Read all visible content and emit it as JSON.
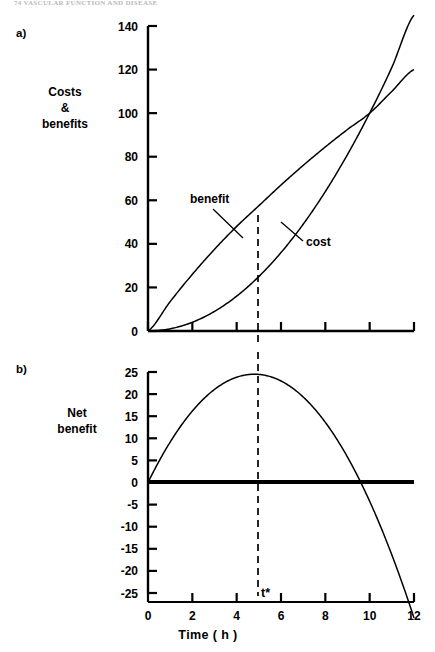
{
  "figure": {
    "running_head": "74  VASCULAR FUNCTION AND DISEASE",
    "panels": [
      {
        "letter": "a)",
        "y_axis_title": "Costs\n&\nbenefits"
      },
      {
        "letter": "b)",
        "y_axis_title": "Net\nbenefit"
      }
    ],
    "x_axis_title": "Time ( h )",
    "marker_label": "t*",
    "marker_value": 5,
    "curve_labels": {
      "benefit": "benefit",
      "cost": "cost"
    },
    "colors": {
      "ink": "#000000",
      "background": "#ffffff",
      "running_head": "#b9b9bd"
    }
  },
  "chart_data": [
    {
      "type": "line",
      "panel": "a)",
      "title": "",
      "xlabel": "Time ( h )",
      "ylabel": "Costs & benefits",
      "xlim": [
        0,
        12
      ],
      "ylim": [
        0,
        145
      ],
      "xticks": [
        0,
        2,
        4,
        6,
        8,
        10,
        12
      ],
      "yticks": [
        0,
        20,
        40,
        60,
        80,
        100,
        120,
        140
      ],
      "xticklabels": [
        "0",
        "2",
        "4",
        "6",
        "8",
        "10",
        "12"
      ],
      "yticklabels": [
        "0",
        "20",
        "40",
        "60",
        "80",
        "100",
        "120",
        "140"
      ],
      "grid": false,
      "legend": "inline-annotations",
      "x": [
        0,
        1,
        2,
        3,
        4,
        5,
        6,
        7,
        8,
        9,
        10,
        11,
        12
      ],
      "series": [
        {
          "name": "benefit",
          "shape": "concave-increasing",
          "values": [
            0,
            13.5,
            26,
            37.5,
            48,
            57.5,
            67,
            76,
            84.5,
            92.5,
            100,
            110,
            120
          ],
          "annotation": "benefit",
          "annotation_xy": [
            2.0,
            56
          ]
        },
        {
          "name": "cost",
          "shape": "convex-increasing",
          "values": [
            0,
            1,
            4,
            9,
            16,
            25,
            36,
            49,
            64,
            81,
            100,
            121,
            145
          ],
          "annotation": "cost",
          "annotation_xy": [
            7.4,
            46
          ]
        }
      ],
      "annotations": [
        {
          "text": "benefit",
          "x": 2.0,
          "y": 56
        },
        {
          "text": "cost",
          "x": 7.4,
          "y": 46
        },
        {
          "text": "vertical dashed line",
          "x": 5,
          "y": null
        }
      ]
    },
    {
      "type": "line",
      "panel": "b)",
      "title": "",
      "xlabel": "Time ( h )",
      "ylabel": "Net benefit",
      "xlim": [
        0,
        12
      ],
      "ylim": [
        -25,
        25
      ],
      "xticks": [
        0,
        2,
        4,
        6,
        8,
        10,
        12
      ],
      "yticks": [
        -25,
        -20,
        -15,
        -10,
        -5,
        0,
        5,
        10,
        15,
        20,
        25
      ],
      "xticklabels": [
        "0",
        "2",
        "4",
        "6",
        "8",
        "10",
        "12"
      ],
      "yticklabels": [
        "25",
        "20",
        "15",
        "10",
        "5",
        "0",
        "-5",
        "-10",
        "-15",
        "-20",
        "-25"
      ],
      "grid": false,
      "legend": "none",
      "x": [
        0,
        1,
        2,
        3,
        4,
        5,
        6,
        7,
        8,
        9,
        10,
        11,
        12
      ],
      "series": [
        {
          "name": "net benefit",
          "shape": "inverted-parabola",
          "values": [
            0,
            12.5,
            22,
            28.5,
            32,
            32.5,
            31,
            27,
            20.5,
            11.5,
            0,
            -11,
            -25
          ],
          "peak_x": 4.8,
          "peak_y": 24.5,
          "zero_crossings": [
            0,
            10
          ]
        }
      ],
      "annotations": [
        {
          "text": "t*",
          "x": 5,
          "y": -23
        },
        {
          "text": "vertical dashed line",
          "x": 5,
          "y": null
        },
        {
          "text": "zero reference line",
          "x": null,
          "y": 0
        }
      ]
    }
  ]
}
